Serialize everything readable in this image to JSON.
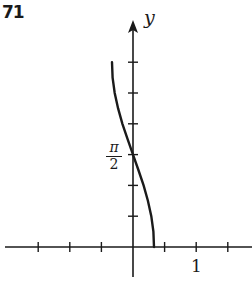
{
  "figure": {
    "number": "71",
    "y_axis_label": "y",
    "x_tick_label": "1",
    "y_tick_label_num": "π",
    "y_tick_label_den": "2"
  },
  "chart_data": {
    "type": "line",
    "title": "71",
    "xlabel": "",
    "ylabel": "y",
    "x_ticks": [
      -1.5,
      -1,
      -0.5,
      0.5,
      1,
      1.5
    ],
    "x_tick_labels": {
      "1": "1"
    },
    "y_ticks": [
      "π/6",
      "π/3",
      "π/2",
      "2π/3",
      "5π/6",
      "π"
    ],
    "y_tick_labels": {
      "π/2": "π/2"
    },
    "xlim": [
      -2.1,
      1.9
    ],
    "ylim": [
      0,
      3.46
    ],
    "grid": false,
    "legend": null,
    "series": [
      {
        "name": "x = (1/3)cos(y)",
        "points": [
          {
            "x": 0.333,
            "y": 0
          },
          {
            "x": 0.322,
            "y": 0.262
          },
          {
            "x": 0.289,
            "y": 0.524
          },
          {
            "x": 0.236,
            "y": 0.785
          },
          {
            "x": 0.167,
            "y": 1.047
          },
          {
            "x": 0.086,
            "y": 1.309
          },
          {
            "x": 0.0,
            "y": 1.571
          },
          {
            "x": -0.086,
            "y": 1.833
          },
          {
            "x": -0.167,
            "y": 2.094
          },
          {
            "x": -0.236,
            "y": 2.356
          },
          {
            "x": -0.289,
            "y": 2.618
          },
          {
            "x": -0.322,
            "y": 2.88
          },
          {
            "x": -0.333,
            "y": 3.142
          }
        ]
      }
    ]
  }
}
